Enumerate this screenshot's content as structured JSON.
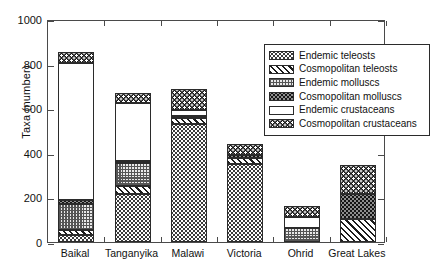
{
  "chart_data": {
    "type": "bar",
    "stacked": true,
    "title": "",
    "xlabel": "",
    "ylabel": "Taxa (number)",
    "ylim": [
      0,
      1000
    ],
    "yticks": [
      0,
      200,
      400,
      600,
      800,
      1000
    ],
    "ytick_labels": [
      "0",
      "200",
      "400",
      "600",
      "800",
      "1000"
    ],
    "grid": false,
    "legend_position": "upper right",
    "categories": [
      "Baikal",
      "Tanganyika",
      "Malawi",
      "Victoria",
      "Ohrid",
      "Great Lakes"
    ],
    "series": [
      {
        "name": "Endemic teleosts",
        "pattern": "dense-stipple",
        "values": [
          30,
          215,
          530,
          350,
          0,
          0
        ]
      },
      {
        "name": "Cosmopolitan teleosts",
        "pattern": "diagonal-hatch",
        "values": [
          25,
          35,
          25,
          25,
          0,
          105
        ]
      },
      {
        "name": "Endemic molluscs",
        "pattern": "fine-crosshatch",
        "values": [
          115,
          105,
          0,
          0,
          65,
          0
        ]
      },
      {
        "name": "Cosmopolitan molluscs",
        "pattern": "solid-dark-speckle",
        "values": [
          20,
          10,
          10,
          15,
          0,
          110
        ]
      },
      {
        "name": "Endemic crustaceans",
        "pattern": "white",
        "values": [
          615,
          260,
          25,
          0,
          45,
          0
        ]
      },
      {
        "name": "Cosmopolitan crustaceans",
        "pattern": "dark-checker",
        "values": [
          45,
          45,
          95,
          50,
          50,
          130
        ]
      }
    ],
    "totals": [
      850,
      670,
      685,
      440,
      160,
      345
    ]
  },
  "legend": {
    "items": [
      {
        "label": "Endemic teleosts"
      },
      {
        "label": "Cosmopolitan teleosts"
      },
      {
        "label": "Endemic molluscs"
      },
      {
        "label": "Cosmopolitan molluscs"
      },
      {
        "label": "Endemic crustaceans"
      },
      {
        "label": "Cosmopolitan crustaceans"
      }
    ]
  },
  "colors": {
    "axis": "#4a4a4a",
    "text": "#111111",
    "frame": "#2b2b2b",
    "background": "#ffffff"
  }
}
